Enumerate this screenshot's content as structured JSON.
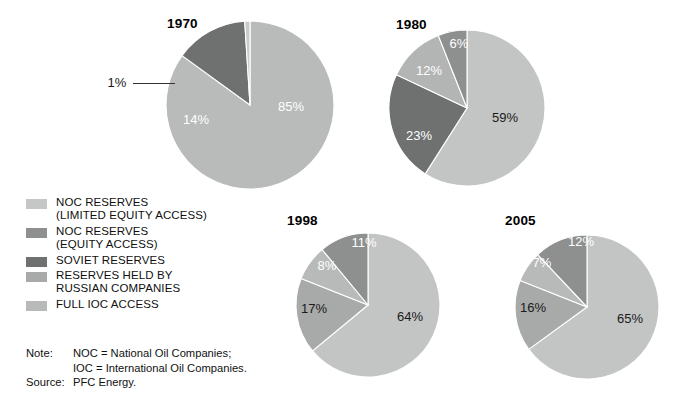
{
  "chart_data": [
    {
      "type": "pie",
      "title": "1970",
      "categories": [
        "NOC RESERVES (LIMITED EQUITY ACCESS)",
        "SOVIET RESERVES",
        "FULL IOC ACCESS"
      ],
      "values": [
        85,
        14,
        1
      ],
      "labels": [
        "85%",
        "14%",
        "1%"
      ],
      "colors": [
        "#b9bbba",
        "#6e7170",
        "#c9cbca"
      ],
      "legend_position": "left",
      "xlabel": "",
      "ylabel": ""
    },
    {
      "type": "pie",
      "title": "1980",
      "categories": [
        "NOC RESERVES (LIMITED EQUITY ACCESS)",
        "SOVIET RESERVES",
        "RESERVES HELD BY RUSSIAN COMPANIES",
        "NOC RESERVES (EQUITY ACCESS)"
      ],
      "values": [
        59,
        23,
        12,
        6
      ],
      "labels": [
        "59%",
        "23%",
        "12%",
        "6%"
      ],
      "colors": [
        "#c3c5c4",
        "#6e7170",
        "#b3b5b4",
        "#8e908f"
      ],
      "legend_position": "left",
      "xlabel": "",
      "ylabel": ""
    },
    {
      "type": "pie",
      "title": "1998",
      "categories": [
        "NOC RESERVES (LIMITED EQUITY ACCESS)",
        "RESERVES HELD BY RUSSIAN COMPANIES",
        "FULL IOC ACCESS",
        "NOC RESERVES (EQUITY ACCESS)"
      ],
      "values": [
        64,
        17,
        8,
        11
      ],
      "labels": [
        "64%",
        "17%",
        "8%",
        "11%"
      ],
      "colors": [
        "#c3c5c4",
        "#a8aaa9",
        "#b8baba",
        "#8e908f"
      ],
      "legend_position": "left",
      "xlabel": "",
      "ylabel": ""
    },
    {
      "type": "pie",
      "title": "2005",
      "categories": [
        "NOC RESERVES (LIMITED EQUITY ACCESS)",
        "RESERVES HELD BY RUSSIAN COMPANIES",
        "FULL IOC ACCESS",
        "NOC RESERVES (EQUITY ACCESS)"
      ],
      "values": [
        65,
        16,
        7,
        12
      ],
      "labels": [
        "65%",
        "16%",
        "7%",
        "12%"
      ],
      "colors": [
        "#c3c5c4",
        "#a8aaa9",
        "#b8baba",
        "#8e908f"
      ],
      "legend_position": "left",
      "xlabel": "",
      "ylabel": ""
    }
  ],
  "charts": {
    "c1970": {
      "title": "1970",
      "slices": [
        {
          "label": "85%",
          "value": 85
        },
        {
          "label": "14%",
          "value": 14
        },
        {
          "label": "1%",
          "value": 1
        }
      ]
    },
    "c1980": {
      "title": "1980",
      "slices": [
        {
          "label": "59%",
          "value": 59
        },
        {
          "label": "23%",
          "value": 23
        },
        {
          "label": "12%",
          "value": 12
        },
        {
          "label": "6%",
          "value": 6
        }
      ]
    },
    "c1998": {
      "title": "1998",
      "slices": [
        {
          "label": "64%",
          "value": 64
        },
        {
          "label": "17%",
          "value": 17
        },
        {
          "label": "8%",
          "value": 8
        },
        {
          "label": "11%",
          "value": 11
        }
      ]
    },
    "c2005": {
      "title": "2005",
      "slices": [
        {
          "label": "65%",
          "value": 65
        },
        {
          "label": "16%",
          "value": 16
        },
        {
          "label": "7%",
          "value": 7
        },
        {
          "label": "12%",
          "value": 12
        }
      ]
    }
  },
  "legend": {
    "items": [
      {
        "label": "NOC RESERVES\n(LIMITED EQUITY ACCESS)",
        "color": "#c5c7c6"
      },
      {
        "label": "NOC RESERVES\n(EQUITY ACCESS)",
        "color": "#8e908f"
      },
      {
        "label": "SOVIET RESERVES",
        "color": "#6e7170"
      },
      {
        "label": "RESERVES HELD BY\nRUSSIAN COMPANIES",
        "color": "#a8aaa9"
      },
      {
        "label": "FULL IOC ACCESS",
        "color": "#b8baba"
      }
    ]
  },
  "notes": {
    "note_key": "Note:",
    "note_line1": "NOC = National Oil Companies;",
    "note_line2": "IOC = International Oil Companies.",
    "source_key": "Source:",
    "source_value": "PFC Energy."
  }
}
